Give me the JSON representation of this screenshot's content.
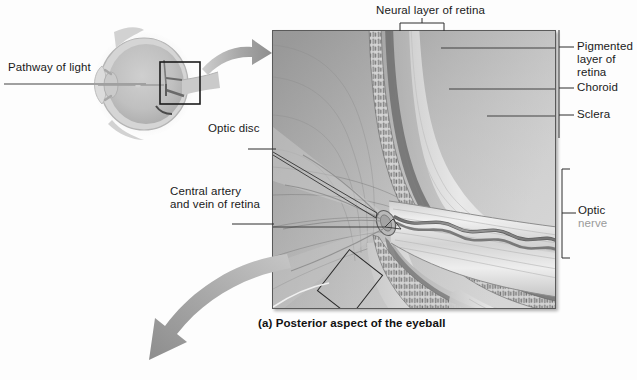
{
  "figure": {
    "caption": "(a) Posterior aspect of the eyeball",
    "background_color": "#fdfdfd",
    "ink_color": "#1a1a1a"
  },
  "labels": {
    "pathway_of_light": "Pathway of light",
    "neural_layer_of_retina": "Neural layer of retina",
    "pigmented_layer_line1": "Pigmented",
    "pigmented_layer_line2": "layer of",
    "pigmented_layer_line3": "retina",
    "choroid": "Choroid",
    "sclera": "Sclera",
    "optic_disc": "Optic disc",
    "central_artery_line1": "Central artery",
    "central_artery_line2": "and vein of retina",
    "optic_nerve_line1": "Optic",
    "optic_nerve_line2": "nerve"
  },
  "icons": {
    "eye_diagram": "eyeball-sagittal-icon",
    "magnify_arrow": "curved-arrow-icon",
    "overview_arrow": "large-curved-arrow-icon",
    "inset_box": "magnified-region-box-icon",
    "retina_layer_box": "retina-layer-highlight-box-icon",
    "optic_nerve_bracket": "bracket-icon",
    "neural_layer_bracket": "bracket-icon"
  },
  "colors": {
    "panel_border": "#5a5a5a",
    "leader_line": "#3a3a3a",
    "arrow_gray": "#9b9b9b",
    "tissue_light": "#e6e6e6",
    "tissue_mid": "#b4b4b4",
    "tissue_dark": "#7d7d7d"
  }
}
